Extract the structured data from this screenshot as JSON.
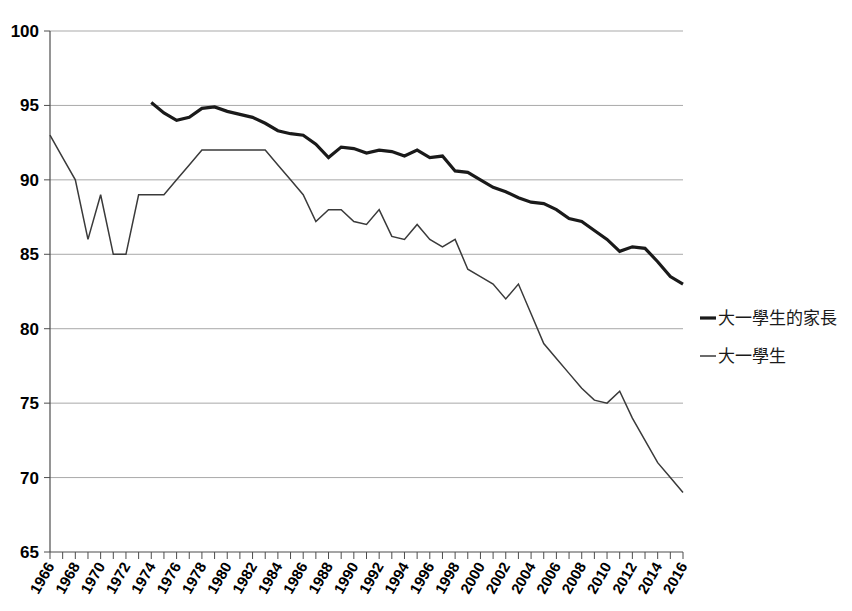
{
  "chart_data": {
    "type": "line",
    "title": "",
    "subtitle": "",
    "xlabel": "",
    "ylabel": "",
    "xlim": [
      1966,
      2016
    ],
    "ylim": [
      65,
      100
    ],
    "ytick_values": [
      65,
      70,
      75,
      80,
      85,
      90,
      95,
      100
    ],
    "ytick_labels": [
      "65",
      "70",
      "75",
      "80",
      "85",
      "90",
      "95",
      "100"
    ],
    "xtick_labels": [
      "1966",
      "1968",
      "1970",
      "1972",
      "1974",
      "1976",
      "1978",
      "1980",
      "1982",
      "1984",
      "1986",
      "1988",
      "1990",
      "1992",
      "1994",
      "1996",
      "1998",
      "2000",
      "2002",
      "2004",
      "2006",
      "2008",
      "2010",
      "2012",
      "2014",
      "2016"
    ],
    "xtick_step_years": 2,
    "minor_tick_step_years": 1,
    "grid": "horizontal",
    "legend_position": "right",
    "series": [
      {
        "name": "大一學生的家長",
        "color": "#1a1a1a",
        "line_width": 3.2,
        "x": [
          1974,
          1975,
          1976,
          1977,
          1978,
          1979,
          1980,
          1981,
          1982,
          1983,
          1984,
          1985,
          1986,
          1987,
          1988,
          1989,
          1990,
          1991,
          1992,
          1993,
          1994,
          1995,
          1996,
          1997,
          1998,
          1999,
          2000,
          2001,
          2002,
          2003,
          2004,
          2005,
          2006,
          2007,
          2008,
          2009,
          2010,
          2011,
          2012,
          2013,
          2014,
          2015,
          2016
        ],
        "values": [
          95.2,
          94.5,
          94.0,
          94.2,
          94.8,
          94.9,
          94.6,
          94.4,
          94.2,
          93.8,
          93.3,
          93.1,
          93.0,
          92.4,
          91.5,
          92.2,
          92.1,
          91.8,
          92.0,
          91.9,
          91.6,
          92.0,
          91.5,
          91.6,
          90.6,
          90.5,
          90.0,
          89.5,
          89.2,
          88.8,
          88.5,
          88.4,
          88.0,
          87.4,
          87.2,
          86.6,
          86.0,
          85.2,
          85.5,
          85.4,
          84.5,
          83.5,
          83.0
        ]
      },
      {
        "name": "大一學生",
        "color": "#3a3a3a",
        "line_width": 1.5,
        "x": [
          1966,
          1967,
          1968,
          1969,
          1970,
          1971,
          1972,
          1973,
          1974,
          1975,
          1976,
          1977,
          1978,
          1979,
          1980,
          1981,
          1982,
          1983,
          1984,
          1985,
          1986,
          1987,
          1988,
          1989,
          1990,
          1991,
          1992,
          1993,
          1994,
          1995,
          1996,
          1997,
          1998,
          1999,
          2000,
          2001,
          2002,
          2003,
          2004,
          2005,
          2006,
          2007,
          2008,
          2009,
          2010,
          2011,
          2012,
          2013,
          2014,
          2015,
          2016
        ],
        "values": [
          93.0,
          91.5,
          90.0,
          86.0,
          89.0,
          85.0,
          85.0,
          89.0,
          89.0,
          89.0,
          90.0,
          91.0,
          92.0,
          92.0,
          92.0,
          92.0,
          92.0,
          92.0,
          91.0,
          90.0,
          89.0,
          87.2,
          88.0,
          88.0,
          87.2,
          87.0,
          88.0,
          86.2,
          86.0,
          87.0,
          86.0,
          85.5,
          86.0,
          84.0,
          83.5,
          83.0,
          82.0,
          83.0,
          81.0,
          79.0,
          78.0,
          77.0,
          76.0,
          75.2,
          75.0,
          75.8,
          74.0,
          72.5,
          71.0,
          70.0,
          69.0
        ]
      }
    ]
  },
  "legend": {
    "items": [
      {
        "label": "大一學生的家長",
        "marker": "thick-line"
      },
      {
        "label": "大一學生",
        "marker": "thin-line"
      }
    ]
  },
  "colors": {
    "background": "#ffffff",
    "grid": "#a9a9a9",
    "axis": "#4d4d4d",
    "series_thick": "#1a1a1a",
    "series_thin": "#3a3a3a",
    "text": "#000000"
  }
}
